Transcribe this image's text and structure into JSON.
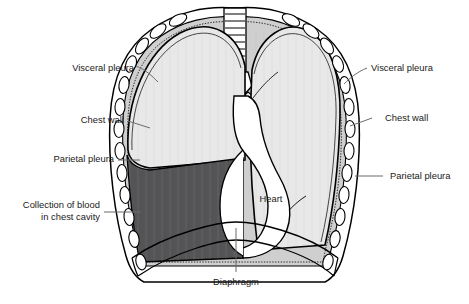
{
  "diagram": {
    "type": "anatomical-illustration",
    "colors": {
      "background": "#ffffff",
      "lung_fill": "#e8e8e8",
      "blood_fill": "#555557",
      "pleura_band": "#cfcfcf",
      "outline": "#000000",
      "rib_fill": "#ffffff",
      "heart_fill": "#ffffff",
      "leader_line": "#6b6b6b",
      "text": "#1a1a1a"
    }
  },
  "labels": {
    "visceral_pleura_left": "Visceral pleura",
    "chest_wall_left": "Chest wall",
    "parietal_pleura_left": "Parietal pleura",
    "collection_line1": "Collection of blood",
    "collection_line2": "in chest cavity",
    "visceral_pleura_right": "Visceral pleura",
    "chest_wall_right": "Chest wall",
    "parietal_pleura_right": "Parietal pleura",
    "heart": "Heart",
    "diaphragm": "Diaphragm"
  },
  "structures": {
    "trachea": "trachea-with-cartilage-rings",
    "left_lung": "collapsed-lung-light-gray",
    "right_lung": "expanded-lung-light-gray",
    "blood_collection": "hemothorax-dark-gray-region",
    "ribs": "rib-cross-sections-oval",
    "diaphragm_band": "curved-diaphragm-band",
    "heart_outline": "mediastinal-heart-silhouette"
  }
}
